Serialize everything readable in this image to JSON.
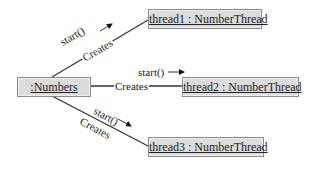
{
  "diagram": {
    "type": "uml-object-collaboration",
    "objects": [
      {
        "id": "numbers",
        "label": ":Numbers"
      },
      {
        "id": "thread1",
        "label": "thread1 : NumberThread"
      },
      {
        "id": "thread2",
        "label": "thread2 : NumberThread"
      },
      {
        "id": "thread3",
        "label": "thread3 : NumberThread"
      }
    ],
    "links": [
      {
        "from": "numbers",
        "to": "thread1",
        "relation": "Creates",
        "message": "start()",
        "arrow": "→"
      },
      {
        "from": "numbers",
        "to": "thread2",
        "relation": "Creates",
        "message": "start()",
        "arrow": "→"
      },
      {
        "from": "numbers",
        "to": "thread3",
        "relation": "Creates",
        "message": "start()",
        "arrow": "→"
      }
    ],
    "colors": {
      "box_fill": "#dcdcdc",
      "box_border": "#8a8a8a",
      "line": "#333333"
    }
  }
}
